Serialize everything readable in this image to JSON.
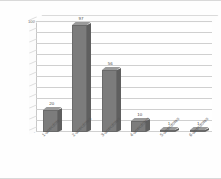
{
  "chart_data": {
    "type": "bar",
    "title": "",
    "xlabel": "",
    "ylabel": "No. of Cluster",
    "categories": [
      "1-anecdote",
      "2-anecdotes",
      "3-anecdotes",
      "4-anecdotes",
      "5-anecdotes",
      "6-anecdotes"
    ],
    "values": [
      20,
      97,
      56,
      10,
      1,
      1
    ],
    "value_labels": [
      "20",
      "97",
      "56",
      "10",
      "1",
      "1"
    ],
    "ylim": [
      0,
      100
    ],
    "ytick_step": 10,
    "yticks": [
      "0",
      "10",
      "20",
      "30",
      "40",
      "50",
      "60",
      "70",
      "80",
      "90",
      "100"
    ],
    "grid": true,
    "legend": "none",
    "style": "3d-column",
    "bar_color": "#7c7c7c",
    "bar_side_color": "#5f5f5f",
    "bar_top_color": "#9a9a9a",
    "gridline_color": "#d0d0d0",
    "background_color": "#ffffff"
  }
}
